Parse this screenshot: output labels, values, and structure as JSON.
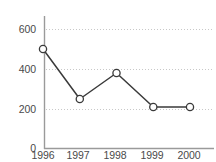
{
  "chart_data": {
    "type": "line",
    "title": "",
    "xlabel": "",
    "ylabel": "",
    "categories": [
      "1996",
      "1997",
      "1998",
      "1999",
      "2000"
    ],
    "values": [
      500,
      250,
      380,
      210,
      210
    ],
    "series": [
      {
        "name": "series-1",
        "values": [
          500,
          250,
          380,
          210,
          210
        ]
      }
    ],
    "ylim": [
      0,
      680
    ],
    "yticks": [
      0,
      200,
      400,
      600
    ],
    "ytick_labels": [
      "0",
      "200",
      "400",
      "600"
    ],
    "xtick_labels": [
      "1996",
      "1997",
      "1998",
      "1999",
      "2000"
    ],
    "grid": "horizontal-dotted",
    "gridlines_at": [
      200,
      400,
      600
    ],
    "legend": "none",
    "marker": "open-circle",
    "colors": {
      "line": "#3a3a3a",
      "marker_fill": "#ffffff",
      "marker_edge": "#3a3a3a",
      "grid": "#c8c8c8",
      "axis": "#9a9a9a",
      "tick_text": "#4a4a4a",
      "background": "#ffffff"
    }
  },
  "axes": {
    "y_labels": [
      "600",
      "400",
      "200",
      "0"
    ],
    "x_labels": [
      "1996",
      "1997",
      "1998",
      "1999",
      "2000"
    ]
  }
}
